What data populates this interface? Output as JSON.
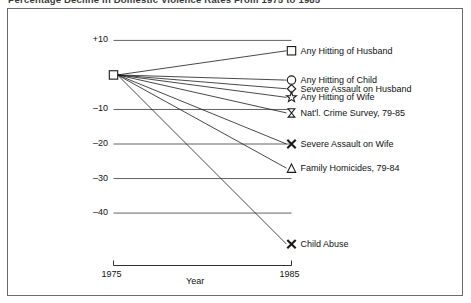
{
  "figure": {
    "title": "Percentage Decline in Domestic Violence Rates From 1975 to 1985",
    "border_color": "#6a6a6a",
    "line_color": "#1a1a1a",
    "grid_color": "#3a3a3a"
  },
  "axis": {
    "ylabel": "",
    "xlabel": "Year",
    "yticks": [
      "+10",
      "–10",
      "–20",
      "–30",
      "–40"
    ],
    "ytick_values": [
      10,
      -10,
      -20,
      -30,
      -40
    ],
    "xticks": [
      "1975",
      "1985"
    ],
    "xtick_values": [
      1975,
      1985
    ]
  },
  "chart_data": {
    "type": "line",
    "title": "Percentage Decline in Domestic Violence Rates From 1975 to 1985",
    "xlabel": "Year",
    "ylabel": "",
    "x": [
      1975,
      1985
    ],
    "xlim": [
      1975,
      1985
    ],
    "ylim": [
      -52,
      12
    ],
    "grid": true,
    "legend_position": "right-inline",
    "origin_value": 0,
    "origin_marker": "square",
    "series": [
      {
        "name": "Any Hitting of Husband",
        "marker": "square",
        "values": [
          0,
          7.0
        ]
      },
      {
        "name": "Any Hitting of Child",
        "marker": "circle",
        "values": [
          0,
          -1.5
        ]
      },
      {
        "name": "Severe Assault on Husband",
        "marker": "diamond",
        "values": [
          0,
          -4.0
        ]
      },
      {
        "name": "Any Hitting of Wife",
        "marker": "star",
        "values": [
          0,
          -6.5
        ]
      },
      {
        "name": "Nat'l. Crime Survey, 79-85",
        "marker": "hourglass",
        "values": [
          0,
          -11.0
        ]
      },
      {
        "name": "Severe Assault on Wife",
        "marker": "x",
        "values": [
          0,
          -20.0
        ]
      },
      {
        "name": "Family Homicides, 79-84",
        "marker": "triangle",
        "values": [
          0,
          -27.0
        ]
      },
      {
        "name": "Child Abuse",
        "marker": "x",
        "values": [
          0,
          -49.0
        ]
      }
    ]
  }
}
